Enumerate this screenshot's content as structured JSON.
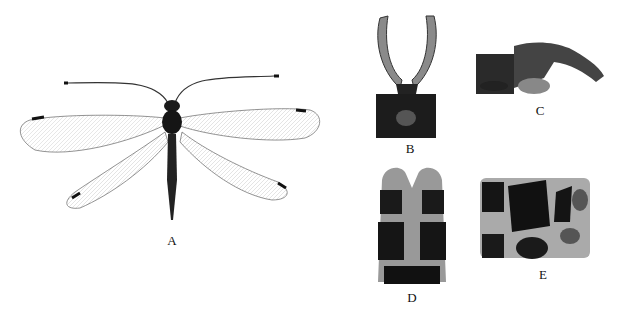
{
  "figure": {
    "panels": [
      {
        "id": "A",
        "label": "A",
        "description": "adult specimen, dorsal view, wings spread"
      },
      {
        "id": "B",
        "label": "B",
        "description": "male terminalia, dorsal view"
      },
      {
        "id": "C",
        "label": "C",
        "description": "male terminalia, lateral view"
      },
      {
        "id": "D",
        "label": "D",
        "description": "female terminalia, ventral view"
      },
      {
        "id": "E",
        "label": "E",
        "description": "female terminalia, lateral view"
      }
    ]
  }
}
